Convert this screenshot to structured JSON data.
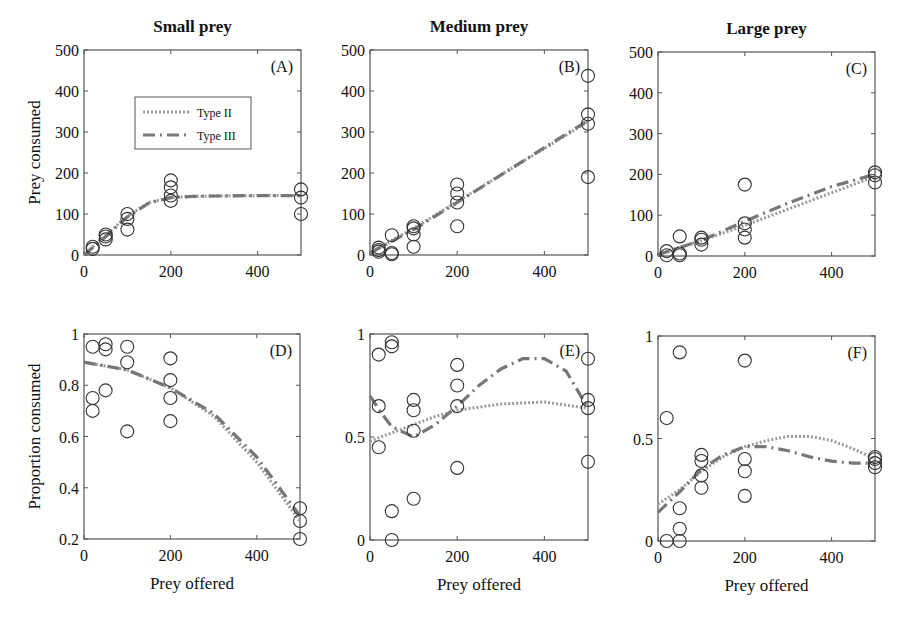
{
  "figure": {
    "y_label_top": "Prey consumed",
    "y_label_bottom": "Proportion consumed",
    "x_label": "Prey offered"
  },
  "legend": {
    "items": [
      {
        "label": "Type II",
        "style": "dotted",
        "color": "#9a9a9a"
      },
      {
        "label": "Type III",
        "style": "dashed",
        "color": "#7a7a7a"
      }
    ]
  },
  "colors": {
    "axis": "#555555",
    "marker": "#333333",
    "type2": "#9a9a9a",
    "type3": "#777777"
  },
  "chart_data": [
    {
      "type": "scatter",
      "panel": "(A)",
      "title": "Small prey",
      "xlabel": "",
      "ylabel": "Prey consumed",
      "xlim": [
        0,
        500
      ],
      "ylim": [
        0,
        500
      ],
      "xticks": [
        0,
        200,
        400
      ],
      "yticks": [
        0,
        100,
        200,
        300,
        400,
        500
      ],
      "points": {
        "x": [
          20,
          20,
          50,
          50,
          50,
          100,
          100,
          100,
          200,
          200,
          200,
          200,
          500,
          500,
          500
        ],
        "y": [
          20,
          15,
          50,
          45,
          38,
          100,
          88,
          62,
          182,
          165,
          145,
          132,
          160,
          140,
          100
        ]
      },
      "series": [
        {
          "name": "Type II",
          "x": [
            0,
            20,
            50,
            100,
            150,
            200,
            250,
            300,
            400,
            500
          ],
          "y": [
            0,
            20,
            48,
            95,
            128,
            140,
            143,
            144,
            145,
            145
          ]
        },
        {
          "name": "Type III",
          "x": [
            0,
            20,
            50,
            100,
            150,
            200,
            250,
            300,
            400,
            500
          ],
          "y": [
            0,
            18,
            45,
            93,
            127,
            140,
            143,
            144,
            145,
            145
          ]
        }
      ],
      "legend_position": "upper-left-inside"
    },
    {
      "type": "scatter",
      "panel": "(B)",
      "title": "Medium prey",
      "xlabel": "",
      "ylabel": "",
      "xlim": [
        0,
        500
      ],
      "ylim": [
        0,
        500
      ],
      "xticks": [
        0,
        200,
        400
      ],
      "yticks": [
        0,
        100,
        200,
        300,
        400,
        500
      ],
      "points": {
        "x": [
          20,
          20,
          20,
          50,
          50,
          50,
          100,
          100,
          100,
          100,
          200,
          200,
          200,
          200,
          500,
          500,
          500,
          500
        ],
        "y": [
          18,
          12,
          8,
          48,
          5,
          2,
          70,
          65,
          50,
          20,
          172,
          150,
          128,
          70,
          437,
          343,
          320,
          190
        ]
      },
      "series": [
        {
          "name": "Type II",
          "x": [
            0,
            100,
            200,
            300,
            400,
            500
          ],
          "y": [
            5,
            65,
            130,
            195,
            260,
            325
          ]
        },
        {
          "name": "Type III",
          "x": [
            0,
            100,
            200,
            300,
            400,
            500
          ],
          "y": [
            5,
            62,
            128,
            195,
            262,
            328
          ]
        }
      ]
    },
    {
      "type": "scatter",
      "panel": "(C)",
      "title": "Large prey",
      "xlabel": "",
      "ylabel": "",
      "xlim": [
        0,
        500
      ],
      "ylim": [
        0,
        500
      ],
      "xticks": [
        0,
        200,
        400
      ],
      "yticks": [
        0,
        100,
        200,
        300,
        400,
        500
      ],
      "points": {
        "x": [
          20,
          20,
          50,
          50,
          50,
          100,
          100,
          100,
          200,
          200,
          200,
          200,
          500,
          500,
          500
        ],
        "y": [
          12,
          2,
          48,
          6,
          2,
          45,
          40,
          28,
          175,
          80,
          65,
          45,
          205,
          198,
          180
        ]
      },
      "series": [
        {
          "name": "Type II",
          "x": [
            0,
            100,
            200,
            300,
            400,
            500
          ],
          "y": [
            5,
            38,
            75,
            115,
            155,
            195
          ]
        },
        {
          "name": "Type III",
          "x": [
            0,
            100,
            200,
            300,
            400,
            500
          ],
          "y": [
            3,
            38,
            85,
            130,
            170,
            200
          ]
        }
      ]
    },
    {
      "type": "scatter",
      "panel": "(D)",
      "title": "",
      "xlabel": "Prey offered",
      "ylabel": "Proportion consumed",
      "xlim": [
        0,
        500
      ],
      "ylim": [
        0.2,
        1
      ],
      "xticks": [
        0,
        200,
        400
      ],
      "yticks": [
        0.2,
        0.4,
        0.6,
        0.8,
        1
      ],
      "points": {
        "x": [
          20,
          20,
          20,
          50,
          50,
          50,
          100,
          100,
          100,
          200,
          200,
          200,
          200,
          500,
          500,
          500
        ],
        "y": [
          0.95,
          0.75,
          0.7,
          0.96,
          0.94,
          0.78,
          0.95,
          0.89,
          0.62,
          0.905,
          0.82,
          0.75,
          0.66,
          0.32,
          0.27,
          0.2
        ]
      },
      "series": [
        {
          "name": "Type II",
          "x": [
            0,
            100,
            200,
            300,
            400,
            500
          ],
          "y": [
            0.89,
            0.86,
            0.79,
            0.68,
            0.5,
            0.27
          ]
        },
        {
          "name": "Type III",
          "x": [
            0,
            100,
            200,
            300,
            400,
            500
          ],
          "y": [
            0.89,
            0.86,
            0.79,
            0.69,
            0.52,
            0.29
          ]
        }
      ]
    },
    {
      "type": "scatter",
      "panel": "(E)",
      "title": "",
      "xlabel": "Prey offered",
      "ylabel": "",
      "xlim": [
        0,
        500
      ],
      "ylim": [
        0,
        1
      ],
      "xticks": [
        0,
        200,
        400
      ],
      "yticks": [
        0,
        0.5,
        1
      ],
      "points": {
        "x": [
          20,
          20,
          20,
          50,
          50,
          50,
          50,
          100,
          100,
          100,
          100,
          200,
          200,
          200,
          200,
          500,
          500,
          500,
          500
        ],
        "y": [
          0.9,
          0.65,
          0.45,
          0.96,
          0.94,
          0.14,
          0.0,
          0.68,
          0.63,
          0.53,
          0.2,
          0.85,
          0.75,
          0.65,
          0.35,
          0.88,
          0.68,
          0.64,
          0.38
        ]
      },
      "series": [
        {
          "name": "Type II",
          "x": [
            0,
            50,
            100,
            150,
            200,
            300,
            400,
            500
          ],
          "y": [
            0.48,
            0.52,
            0.56,
            0.6,
            0.63,
            0.66,
            0.67,
            0.64
          ]
        },
        {
          "name": "Type III",
          "x": [
            0,
            25,
            50,
            100,
            150,
            200,
            250,
            300,
            350,
            400,
            450,
            500
          ],
          "y": [
            0.7,
            0.62,
            0.55,
            0.5,
            0.56,
            0.65,
            0.75,
            0.83,
            0.88,
            0.88,
            0.82,
            0.64
          ]
        }
      ]
    },
    {
      "type": "scatter",
      "panel": "(F)",
      "title": "",
      "xlabel": "Prey offered",
      "ylabel": "",
      "xlim": [
        0,
        500
      ],
      "ylim": [
        0,
        1
      ],
      "xticks": [
        0,
        200,
        400
      ],
      "yticks": [
        0,
        0.5,
        1
      ],
      "points": {
        "x": [
          20,
          20,
          50,
          50,
          50,
          50,
          100,
          100,
          100,
          100,
          200,
          200,
          200,
          200,
          500,
          500,
          500,
          500
        ],
        "y": [
          0.6,
          0.0,
          0.92,
          0.16,
          0.06,
          0.0,
          0.42,
          0.39,
          0.32,
          0.26,
          0.88,
          0.4,
          0.34,
          0.22,
          0.41,
          0.4,
          0.38,
          0.36
        ]
      },
      "series": [
        {
          "name": "Type II",
          "x": [
            0,
            50,
            100,
            150,
            200,
            250,
            300,
            350,
            400,
            450,
            500
          ],
          "y": [
            0.18,
            0.25,
            0.34,
            0.41,
            0.46,
            0.49,
            0.51,
            0.51,
            0.49,
            0.45,
            0.4
          ]
        },
        {
          "name": "Type III",
          "x": [
            0,
            50,
            100,
            150,
            200,
            250,
            300,
            350,
            400,
            450,
            500
          ],
          "y": [
            0.14,
            0.24,
            0.35,
            0.42,
            0.46,
            0.46,
            0.44,
            0.41,
            0.39,
            0.38,
            0.38
          ]
        }
      ]
    }
  ]
}
